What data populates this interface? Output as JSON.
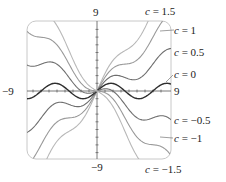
{
  "chart_data": {
    "type": "line",
    "title": "",
    "function": "y = c*x + sin(x)",
    "parameter": "c",
    "xlabel": "",
    "ylabel": "",
    "xlim": [
      -9,
      9
    ],
    "ylim": [
      -9,
      9
    ],
    "grid": false,
    "axis_labels": {
      "top": "9",
      "bottom": "−9",
      "left": "−9",
      "right": "9"
    },
    "series": [
      {
        "name": "c = 1.5",
        "c": 1.5,
        "color": "#b8b8b8"
      },
      {
        "name": "c = 1",
        "c": 1,
        "color": "#9a9a9a"
      },
      {
        "name": "c = 0.5",
        "c": 0.5,
        "color": "#6e6e6e"
      },
      {
        "name": "c = 0",
        "c": 0,
        "color": "#2e2e2e"
      },
      {
        "name": "c = −0.5",
        "c": -0.5,
        "color": "#6e6e6e"
      },
      {
        "name": "c = −1",
        "c": -1,
        "color": "#9a9a9a"
      },
      {
        "name": "c = −1.5",
        "c": -1.5,
        "color": "#b8b8b8"
      }
    ],
    "legend_position": "right, inline labels"
  },
  "labels": {
    "top": "9",
    "bottom": "−9",
    "left": "−9",
    "right": "9",
    "c15": "= 1.5",
    "c1": "= 1",
    "c05": "= 0.5",
    "c0": "= 0",
    "cm05": "= −0.5",
    "cm1": "= −1",
    "cm15": "= −1.5",
    "cvar": "c"
  }
}
